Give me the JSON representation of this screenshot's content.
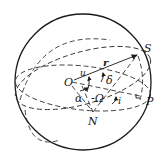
{
  "diagram": {
    "type": "celestial-sphere-orbital-elements",
    "labels": {
      "origin": "O",
      "satellite": "S",
      "perigee": "P",
      "ascending_node": "N",
      "radius_vector": "r",
      "argument_of_latitude": "u",
      "declination": "δ",
      "right_ascension": "α",
      "raan": "-Ω",
      "inclination": "i"
    },
    "colors": {
      "stroke": "#1a1a1a",
      "background": "#ffffff"
    }
  }
}
